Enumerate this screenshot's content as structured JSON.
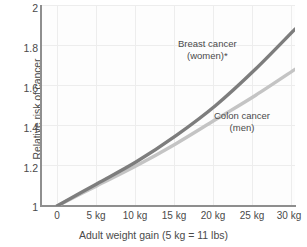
{
  "chart_data": {
    "type": "line",
    "title": "",
    "xlabel": "Adult weight gain (5 kg = 11 lbs)",
    "ylabel": "Relative risk of cancer",
    "x": [
      0,
      5,
      10,
      15,
      20,
      25,
      30
    ],
    "xtick_labels": [
      "0",
      "5 kg",
      "10 kg",
      "15 kg",
      "20 kg",
      "25 kg",
      "30 kg"
    ],
    "ytick_labels": [
      "1",
      "1.2",
      "1.4",
      "1.6",
      "1.8",
      "2"
    ],
    "yticks": [
      1,
      1.2,
      1.4,
      1.6,
      1.8,
      2
    ],
    "xlim": [
      0,
      30
    ],
    "ylim": [
      1,
      2
    ],
    "grid": true,
    "legend_position": "inline-annotations",
    "series": [
      {
        "name": "Breast cancer (women)*",
        "label_line1": "Breast cancer",
        "label_line2": "(women)*",
        "color": "#7d7d7d",
        "values": [
          1.0,
          1.11,
          1.22,
          1.35,
          1.5,
          1.68,
          1.88
        ]
      },
      {
        "name": "Colon cancer (men)",
        "label_line1": "Colon cancer",
        "label_line2": "(men)",
        "color": "#c4c4c4",
        "values": [
          1.0,
          1.1,
          1.2,
          1.31,
          1.43,
          1.55,
          1.68
        ]
      }
    ]
  },
  "colors": {
    "axis": "#8e8e8e",
    "grid": "#ededed",
    "text": "#4a4a4a",
    "background": "#ffffff"
  }
}
